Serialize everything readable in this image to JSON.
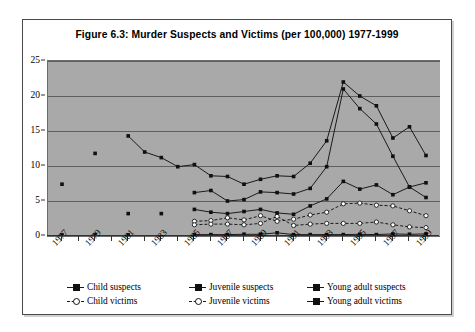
{
  "figure": {
    "title": "Figure 6.3: Murder Suspects and Victims (per 100,000) 1977-1999"
  },
  "chart_data": {
    "type": "line",
    "title": "Figure 6.3: Murder Suspects and Victims (per 100,000) 1977-1999",
    "xlabel": "",
    "ylabel": "",
    "ylim": [
      0,
      25
    ],
    "yticks": [
      0,
      5,
      10,
      15,
      20,
      25
    ],
    "grid": true,
    "legend_position": "bottom",
    "plot_background": "#a9a9a9",
    "line_color": "#1a1a1a",
    "x": [
      1977,
      1978,
      1979,
      1980,
      1981,
      1982,
      1983,
      1984,
      1985,
      1986,
      1987,
      1988,
      1989,
      1990,
      1991,
      1992,
      1993,
      1994,
      1995,
      1996,
      1997,
      1998,
      1999
    ],
    "xtick_labels": [
      "1977",
      "1979",
      "1981",
      "1983",
      "1985",
      "1987",
      "1989",
      "1991",
      "1993",
      "1995",
      "1997",
      "1999"
    ],
    "xtick_values": [
      1977,
      1979,
      1981,
      1983,
      1985,
      1987,
      1989,
      1991,
      1993,
      1995,
      1997,
      1999
    ],
    "series": [
      {
        "name": "Child suspects",
        "marker": "filled-square",
        "line": "solid",
        "values": [
          0.15,
          null,
          0.15,
          null,
          0.15,
          null,
          null,
          null,
          0.2,
          0.2,
          0.2,
          0.25,
          0.25,
          0.45,
          0.2,
          0.2,
          0.2,
          0.2,
          0.25,
          0.2,
          0.3,
          0.25,
          0.3
        ]
      },
      {
        "name": "Juvenile suspects",
        "marker": "filled-square",
        "line": "solid",
        "values": [
          null,
          null,
          null,
          null,
          null,
          null,
          null,
          null,
          6.2,
          6.5,
          5.0,
          5.2,
          6.3,
          6.2,
          6.0,
          6.8,
          9.9,
          21.0,
          18.2,
          16.0,
          11.4,
          7.0,
          5.5
        ]
      },
      {
        "name": "Young adult suspects",
        "marker": "filled-square",
        "line": "solid",
        "values": [
          null,
          null,
          null,
          null,
          14.3,
          12.0,
          11.2,
          9.9,
          10.2,
          8.6,
          8.5,
          7.4,
          8.1,
          8.6,
          8.5,
          10.4,
          13.6,
          22.0,
          20.0,
          18.6,
          14.0,
          15.6,
          11.5
        ]
      },
      {
        "name": "Child victims",
        "marker": "open-circle",
        "line": "dashed",
        "values": [
          null,
          null,
          null,
          null,
          null,
          null,
          null,
          null,
          2.1,
          2.2,
          2.6,
          2.3,
          2.9,
          2.1,
          2.4,
          3.0,
          3.4,
          4.6,
          4.7,
          4.4,
          4.3,
          3.6,
          2.9
        ]
      },
      {
        "name": "Juvenile victims",
        "marker": "open-circle",
        "line": "dashed",
        "values": [
          null,
          null,
          null,
          null,
          null,
          null,
          null,
          null,
          1.6,
          1.7,
          1.7,
          1.6,
          1.8,
          2.8,
          1.5,
          1.7,
          1.8,
          1.8,
          1.8,
          2.0,
          1.6,
          1.3,
          1.2
        ]
      },
      {
        "name": "Young adult victims",
        "marker": "filled-square",
        "line": "solid",
        "values": [
          7.4,
          null,
          11.8,
          null,
          3.2,
          null,
          3.2,
          null,
          3.8,
          3.4,
          3.2,
          3.5,
          3.8,
          3.3,
          3.1,
          4.3,
          5.3,
          7.8,
          6.7,
          7.3,
          5.9,
          7.0,
          7.6
        ]
      }
    ]
  },
  "legend": {
    "items": [
      {
        "label": "Child suspects",
        "marker": "filled-square",
        "line": "solid"
      },
      {
        "label": "Juvenile suspects",
        "marker": "filled-square",
        "line": "solid"
      },
      {
        "label": "Young adult suspects",
        "marker": "filled-square",
        "line": "solid"
      },
      {
        "label": "Child victims",
        "marker": "open-circle",
        "line": "dashed"
      },
      {
        "label": "Juvenile victims",
        "marker": "open-circle",
        "line": "dashed"
      },
      {
        "label": "Young adult victims",
        "marker": "filled-square",
        "line": "solid"
      }
    ]
  }
}
